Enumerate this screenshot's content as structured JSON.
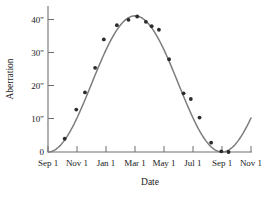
{
  "chart_data": {
    "type": "scatter",
    "title": "",
    "xlabel": "Date",
    "ylabel": "Aberration",
    "xlim": [
      0,
      14
    ],
    "ylim": [
      0,
      45
    ],
    "grid": false,
    "legend": null,
    "x_tick_labels": [
      "Sep 1",
      "Nov 1",
      "Jan 1",
      "Mar 1",
      "May 1",
      "Jul 1",
      "Sep 1",
      "Nov 1"
    ],
    "x_tick_values": [
      0,
      2,
      4,
      6,
      8,
      10,
      12,
      14
    ],
    "y_tick_labels": [
      "0",
      "10″",
      "20″",
      "30″",
      "40″"
    ],
    "y_tick_values": [
      0,
      10,
      20,
      30,
      40
    ],
    "series": [
      {
        "name": "Observed aberration",
        "marker": "filled-circle",
        "color": "#2b2b2b",
        "points": [
          {
            "x": 1.15,
            "y": 4.0
          },
          {
            "x": 1.95,
            "y": 12.8
          },
          {
            "x": 2.55,
            "y": 18.0
          },
          {
            "x": 3.25,
            "y": 25.4
          },
          {
            "x": 3.85,
            "y": 34.0
          },
          {
            "x": 4.75,
            "y": 38.3
          },
          {
            "x": 5.55,
            "y": 39.9
          },
          {
            "x": 6.15,
            "y": 40.9
          },
          {
            "x": 6.75,
            "y": 39.3
          },
          {
            "x": 7.15,
            "y": 38.0
          },
          {
            "x": 7.65,
            "y": 36.9
          },
          {
            "x": 8.35,
            "y": 28.0
          },
          {
            "x": 9.35,
            "y": 17.7
          },
          {
            "x": 9.85,
            "y": 16.0
          },
          {
            "x": 10.45,
            "y": 10.4
          },
          {
            "x": 11.25,
            "y": 2.8
          },
          {
            "x": 11.95,
            "y": 0.2
          },
          {
            "x": 12.45,
            "y": 0.0
          }
        ]
      },
      {
        "name": "Fitted sinusoidal curve",
        "marker": "none",
        "color": "#7d7d7d",
        "description": "Smooth sinusoid rising from 0 at Sep 1, peaking near 41 arcsec at Mar 1, returning to 0 at the following Sep 1, then rising again to about 10 arcsec at Nov 1."
      }
    ]
  },
  "axes": {
    "y_label": "Aberration",
    "x_label": "Date"
  }
}
